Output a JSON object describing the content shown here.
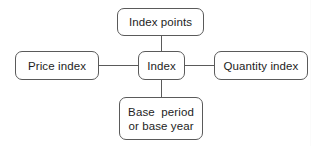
{
  "diagram": {
    "type": "node-link-diagram",
    "background_color": "#ffffff",
    "stroke_color": "#5a5a5a",
    "text_color": "#1d1d1d",
    "nodes": {
      "center": {
        "id": "index",
        "label": "Index"
      },
      "top": {
        "id": "index-points",
        "label": "Index points"
      },
      "left": {
        "id": "price-index",
        "label": "Price index"
      },
      "right": {
        "id": "quantity-index",
        "label": "Quantity index"
      },
      "bottom": {
        "id": "base-period",
        "label_line1": "Base  period",
        "label_line2": "or base year"
      }
    },
    "connectors": [
      {
        "from": "index",
        "to": "index-points",
        "orientation": "vertical"
      },
      {
        "from": "index",
        "to": "price-index",
        "orientation": "horizontal"
      },
      {
        "from": "index",
        "to": "quantity-index",
        "orientation": "horizontal"
      },
      {
        "from": "index",
        "to": "base-period",
        "orientation": "vertical"
      }
    ]
  }
}
